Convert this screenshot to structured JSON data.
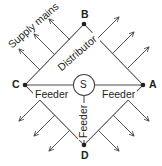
{
  "diagram": {
    "vertices": [
      {
        "id": "vertex-a",
        "label": "A"
      },
      {
        "id": "vertex-b",
        "label": "B"
      },
      {
        "id": "vertex-c",
        "label": "C"
      },
      {
        "id": "vertex-d",
        "label": "D"
      }
    ],
    "center": {
      "label": "S",
      "name": "substation-node"
    },
    "edge_labels": {
      "distributor": "Distributor",
      "supply_mains": "Supply mains",
      "feeder_left": "Feeder",
      "feeder_right": "Feeder",
      "feeder_bottom": "Feeder"
    },
    "colors": {
      "line": "#4a4a4a",
      "text": "#231f20",
      "background": "#ffffff"
    },
    "service_arrow_count_per_edge": 3,
    "distributor_edges": 4
  }
}
